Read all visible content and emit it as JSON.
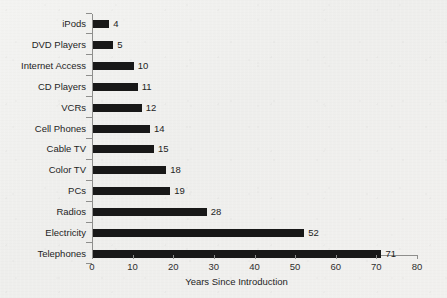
{
  "chart_data": {
    "type": "bar",
    "orientation": "horizontal",
    "title": "",
    "xlabel": "Years Since Introduction",
    "ylabel": "",
    "categories": [
      "iPods",
      "DVD Players",
      "Internet Access",
      "CD Players",
      "VCRs",
      "Cell Phones",
      "Cable TV",
      "Color TV",
      "PCs",
      "Radios",
      "Electricity",
      "Telephones"
    ],
    "values": [
      4,
      5,
      10,
      11,
      12,
      14,
      15,
      18,
      19,
      28,
      52,
      71
    ],
    "data_labels": [
      "4",
      "5",
      "10",
      "11",
      "12",
      "14",
      "15",
      "18",
      "19",
      "28",
      "52",
      "71"
    ],
    "xlim": [
      0,
      80
    ],
    "xticks": [
      0,
      10,
      20,
      30,
      40,
      50,
      60,
      70,
      80
    ],
    "xtick_labels": [
      "0",
      "10",
      "20",
      "30",
      "40",
      "50",
      "60",
      "70",
      "80"
    ],
    "grid": false,
    "legend": null,
    "bar_color": "#181818",
    "background_color": "#f1f1ef",
    "axis_color": "#8e8e8c",
    "text_color": "#242424"
  }
}
